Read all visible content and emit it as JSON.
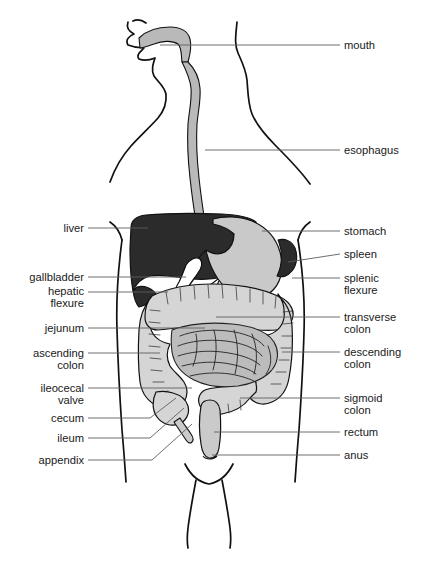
{
  "figure": {
    "type": "anatomical-line-diagram"
  },
  "palette": {
    "background": "#ffffff",
    "ink": "#111111",
    "leader_line": "#5d5d5d",
    "label_text": "#1a1a1a",
    "liver_fill": "#2b2b2b",
    "spleen_fill": "#2b2b2b",
    "stomach_fill": "#c9c9c9",
    "esophagus_fill": "#b9b9b9",
    "mouth_fill": "#b9b9b9",
    "colon_fill": "#d5d5d5",
    "small_intestine_fill": "#bcbcbc",
    "rectum_fill": "#cacaca",
    "gallbladder_fill": "#ffffff"
  },
  "labels_left": [
    {
      "id": "liver",
      "text": "liver",
      "lines": [
        "liver"
      ],
      "x": 84,
      "y": 231,
      "leader": [
        [
          88,
          228
        ],
        [
          148,
          228
        ]
      ]
    },
    {
      "id": "gallbladder",
      "text": "gallbladder",
      "lines": [
        "gallbladder"
      ],
      "x": 84,
      "y": 280,
      "leader": [
        [
          88,
          277
        ],
        [
          186,
          277
        ]
      ]
    },
    {
      "id": "hepatic-flexure",
      "text": "hepatic flexure",
      "lines": [
        "hepatic",
        "flexure"
      ],
      "x": 84,
      "y": 294,
      "leader": [
        [
          88,
          292
        ],
        [
          168,
          292
        ]
      ]
    },
    {
      "id": "jejunum",
      "text": "jejunum",
      "lines": [
        "jejunum"
      ],
      "x": 84,
      "y": 331,
      "leader": [
        [
          88,
          328
        ],
        [
          205,
          328
        ]
      ]
    },
    {
      "id": "ascending-colon",
      "text": "ascending colon",
      "lines": [
        "ascending",
        "colon"
      ],
      "x": 84,
      "y": 356,
      "leader": [
        [
          88,
          353
        ],
        [
          160,
          353
        ]
      ]
    },
    {
      "id": "ileocecal-valve",
      "text": "ileocecal valve",
      "lines": [
        "ileocecal",
        "valve"
      ],
      "x": 84,
      "y": 391,
      "leader": [
        [
          88,
          388
        ],
        [
          192,
          388
        ]
      ]
    },
    {
      "id": "cecum",
      "text": "cecum",
      "lines": [
        "cecum"
      ],
      "x": 84,
      "y": 421,
      "leader": [
        [
          88,
          418
        ],
        [
          176,
          398
        ]
      ]
    },
    {
      "id": "ileum",
      "text": "ileum",
      "lines": [
        "ileum"
      ],
      "x": 84,
      "y": 441,
      "leader": [
        [
          88,
          438
        ],
        [
          182,
          410
        ]
      ]
    },
    {
      "id": "appendix",
      "text": "appendix",
      "lines": [
        "appendix"
      ],
      "x": 84,
      "y": 463,
      "leader": [
        [
          88,
          460
        ],
        [
          196,
          424
        ]
      ]
    }
  ],
  "labels_right": [
    {
      "id": "mouth",
      "text": "mouth",
      "lines": [
        "mouth"
      ],
      "x": 344,
      "y": 48,
      "leader": [
        [
          340,
          45
        ],
        [
          160,
          45
        ]
      ]
    },
    {
      "id": "esophagus",
      "text": "esophagus",
      "lines": [
        "esophagus"
      ],
      "x": 344,
      "y": 153,
      "leader": [
        [
          340,
          150
        ],
        [
          205,
          150
        ]
      ]
    },
    {
      "id": "stomach",
      "text": "stomach",
      "lines": [
        "stomach"
      ],
      "x": 344,
      "y": 234,
      "leader": [
        [
          340,
          231
        ],
        [
          262,
          231
        ]
      ]
    },
    {
      "id": "spleen",
      "text": "spleen",
      "lines": [
        "spleen"
      ],
      "x": 344,
      "y": 257,
      "leader": [
        [
          340,
          254
        ],
        [
          288,
          262
        ]
      ]
    },
    {
      "id": "splenic-flexure",
      "text": "splenic flexure",
      "lines": [
        "splenic",
        "flexure"
      ],
      "x": 344,
      "y": 281,
      "leader": [
        [
          340,
          278
        ],
        [
          292,
          278
        ]
      ]
    },
    {
      "id": "transverse-colon",
      "text": "transverse colon",
      "lines": [
        "transverse",
        "colon"
      ],
      "x": 344,
      "y": 320,
      "leader": [
        [
          340,
          317
        ],
        [
          216,
          317
        ]
      ]
    },
    {
      "id": "descending-colon",
      "text": "descending colon",
      "lines": [
        "descending",
        "colon"
      ],
      "x": 344,
      "y": 355,
      "leader": [
        [
          340,
          352
        ],
        [
          282,
          352
        ]
      ]
    },
    {
      "id": "sigmoid-colon",
      "text": "sigmoid colon",
      "lines": [
        "sigmoid",
        "colon"
      ],
      "x": 344,
      "y": 401,
      "leader": [
        [
          340,
          398
        ],
        [
          240,
          398
        ]
      ]
    },
    {
      "id": "rectum",
      "text": "rectum",
      "lines": [
        "rectum"
      ],
      "x": 344,
      "y": 435,
      "leader": [
        [
          340,
          432
        ],
        [
          214,
          432
        ]
      ]
    },
    {
      "id": "anus",
      "text": "anus",
      "lines": [
        "anus"
      ],
      "x": 344,
      "y": 458,
      "leader": [
        [
          340,
          455
        ],
        [
          212,
          455
        ]
      ]
    }
  ],
  "organs": [
    {
      "id": "mouth",
      "name": "mouth"
    },
    {
      "id": "esophagus",
      "name": "esophagus"
    },
    {
      "id": "stomach",
      "name": "stomach"
    },
    {
      "id": "liver",
      "name": "liver"
    },
    {
      "id": "gallbladder",
      "name": "gallbladder"
    },
    {
      "id": "spleen",
      "name": "spleen"
    },
    {
      "id": "transverse-colon",
      "name": "transverse colon"
    },
    {
      "id": "ascending-colon",
      "name": "ascending colon"
    },
    {
      "id": "descending-colon",
      "name": "descending colon"
    },
    {
      "id": "sigmoid-colon",
      "name": "sigmoid colon"
    },
    {
      "id": "small-intestine",
      "name": "small intestine (jejunum / ileum)"
    },
    {
      "id": "cecum",
      "name": "cecum"
    },
    {
      "id": "appendix",
      "name": "appendix"
    },
    {
      "id": "rectum",
      "name": "rectum"
    },
    {
      "id": "anus",
      "name": "anus"
    }
  ]
}
